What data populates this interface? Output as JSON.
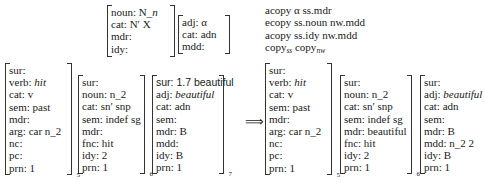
{
  "top": {
    "noun_proplet": {
      "rows": [
        "noun: N_n",
        "cat: N′ X",
        "mdr:",
        "idy:"
      ],
      "noun_value_prefix": "noun: N_",
      "noun_value_italic": "n"
    },
    "adj_proplet": {
      "rows": [
        "adj: α",
        "cat: adn",
        "mdd:"
      ]
    },
    "rules": {
      "line1": "acopy α ss.mdr",
      "line2": "ecopy ss.noun nw.mdd",
      "line3": "acopy ss.idy nw.mdd",
      "line4_a": "copy",
      "line4_a_sub": "ss",
      "line4_b": "copy",
      "line4_b_sub": "nw"
    }
  },
  "arrow": "⟹",
  "input": {
    "verb": {
      "rows": [
        "sur:",
        "verb: ",
        "cat: v",
        "sem: past",
        "mdr:",
        "arg: car n_2",
        "nc:",
        "pc:",
        "prn: 1"
      ],
      "verb_value": "hit",
      "index": "5"
    },
    "noun": {
      "rows": [
        "sur:",
        "noun: n_2",
        "cat: sn′ snp",
        "sem: indef sg",
        "mdr:",
        "fnc: hit",
        "idy: 2",
        "prn: 1"
      ],
      "index": "6"
    },
    "adj": {
      "sur": "sur: 1.7 beautiful",
      "adj_label": "adj: ",
      "adj_value": "beautiful",
      "rows": [
        "cat: adn",
        "sem:",
        "mdr: B",
        "mdd:",
        "idy: B",
        "prn: 1"
      ],
      "index": "7"
    }
  },
  "output": {
    "verb": {
      "rows": [
        "sur:",
        "verb: ",
        "cat: v",
        "sem: past",
        "mdr:",
        "arg: car n_2",
        "nc:",
        "pc:",
        "prn: 1"
      ],
      "verb_value": "hit",
      "index": "5"
    },
    "noun": {
      "rows": [
        "sur:",
        "noun: n_2",
        "cat: sn′ snp",
        "sem: indef sg",
        "mdr: beautiful",
        "fnc: hit",
        "idy: 2",
        "prn: 1"
      ],
      "index": "6"
    },
    "adj": {
      "sur": "sur:",
      "adj_label": "adj: ",
      "adj_value": "beautiful",
      "rows": [
        "cat: adn",
        "sem:",
        "mdr: B",
        "mdd: n_2 2",
        "idy: B",
        "prn: 1"
      ]
    }
  }
}
